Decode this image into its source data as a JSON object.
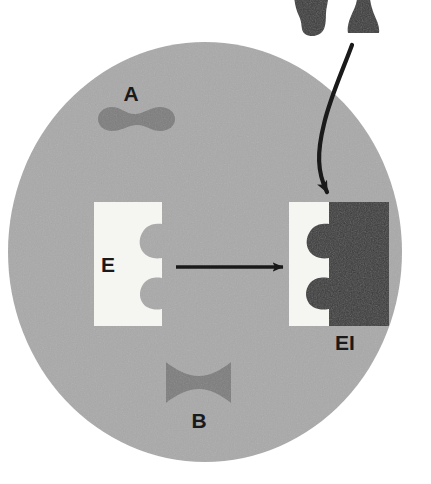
{
  "figure": {
    "background_color": "#ffffff",
    "cell": {
      "name": "cell",
      "fill": "#a9a9a9",
      "center_x": 205,
      "center_y": 252,
      "radius_x": 197,
      "radius_y": 210
    },
    "labels": {
      "substance_a": "A",
      "substance_b": "B",
      "enzyme": "E",
      "enzyme_inhibitor_complex": "EI"
    },
    "colors": {
      "cell_interior": "#a9a9a9",
      "molecule_gray": "#7d7d7d",
      "enzyme_white": "#f5f5f2",
      "inhibitor_dark": "#3a3a3a",
      "arrow_black": "#1a1a1a",
      "label_text": "#1a1a1a"
    },
    "shapes": {
      "molecule_a": {
        "name": "molecule-a-peanut",
        "description": "peanut-shaped gray molecule",
        "fill": "#7d7d7d"
      },
      "molecule_b": {
        "name": "molecule-b-bowtie",
        "description": "hourglass/bowtie-shaped gray molecule",
        "fill": "#7d7d7d"
      },
      "inhibitor_top_left": {
        "name": "inhibitor-teardrop",
        "description": "dark teardrop molecule outside cell",
        "fill": "#3a3a3a"
      },
      "inhibitor_top_right": {
        "name": "inhibitor-flared",
        "description": "dark flared molecule outside cell",
        "fill": "#3a3a3a"
      },
      "enzyme_free": {
        "name": "enzyme-free",
        "description": "white block with two rounded active-site notches on its right edge",
        "fill": "#f5f5f2"
      },
      "enzyme_bound": {
        "name": "enzyme-inhibitor-complex",
        "description": "same white enzyme with dark inhibitor block filling both notches",
        "enzyme_fill": "#f5f5f2",
        "inhibitor_fill": "#3a3a3a"
      }
    },
    "arrows": {
      "reaction_arrow": {
        "name": "reaction-arrow",
        "direction": "left-to-right",
        "color": "#1a1a1a"
      },
      "inhibitor_entry_arrow": {
        "name": "inhibitor-entry-arrow",
        "direction": "curved, top to enzyme-inhibitor complex",
        "color": "#1a1a1a"
      }
    }
  }
}
